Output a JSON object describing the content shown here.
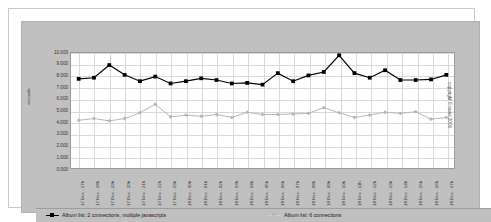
{
  "chart_data": {
    "type": "line",
    "title": "",
    "xlabel": "",
    "ylabel": "seconds",
    "ylim": [
      0,
      10
    ],
    "grid": true,
    "legend_position": "bottom",
    "categories": [
      "17 Dec - 17h",
      "17 Dec - 18h",
      "17 Dec - 19h",
      "17 Dec - 20h",
      "17 Dec - 21h",
      "17 Dec - 22h",
      "17 Dec - 23h",
      "18 Dec - 00h",
      "18 Dec - 01h",
      "18 Dec - 02h",
      "18 Dec - 03h",
      "18 Dec - 04h",
      "18 Dec - 05h",
      "18 Dec - 06h",
      "18 Dec - 07h",
      "18 Dec - 08h",
      "18 Dec - 09h",
      "18 Dec - 10h",
      "18 Dec - 11h",
      "18 Dec - 12h",
      "18 Dec - 13h",
      "18 Dec - 14h",
      "18 Dec - 15h",
      "18 Dec - 16h",
      "18 Dec - 17h"
    ],
    "ytick_labels": [
      "10.000",
      "9.000",
      "8.000",
      "7.000",
      "6.000",
      "5.000",
      "4.000",
      "3.000",
      "2.000",
      "1.000",
      "0.000"
    ],
    "ytick_values": [
      10,
      9,
      8,
      7,
      6,
      5,
      4,
      3,
      2,
      1,
      0
    ],
    "series": [
      {
        "name": "Album list: 2 connections, multiple javascripts",
        "color": "#000000",
        "marker": "square",
        "values": [
          7.75,
          7.85,
          8.95,
          8.1,
          7.55,
          7.95,
          7.35,
          7.55,
          7.8,
          7.65,
          7.35,
          7.4,
          7.25,
          8.25,
          7.55,
          8.05,
          8.35,
          9.8,
          8.25,
          7.85,
          8.5,
          7.65,
          7.65,
          7.7,
          8.1
        ]
      },
      {
        "name": "Album list: 6 connections",
        "color": "#b5b5b5",
        "marker": "diamond",
        "values": [
          4.15,
          4.3,
          4.1,
          4.3,
          4.8,
          5.55,
          4.45,
          4.6,
          4.5,
          4.65,
          4.4,
          4.85,
          4.65,
          4.65,
          4.7,
          4.75,
          5.25,
          4.8,
          4.4,
          4.6,
          4.85,
          4.75,
          4.9,
          4.25,
          4.4
        ]
      }
    ]
  },
  "legend": {
    "items": [
      {
        "label": "Album list: 2 connections, multiple javascripts"
      },
      {
        "label": "Album list: 6 connections"
      }
    ]
  },
  "footer": {
    "copyright": "copyright © ravel 2006"
  },
  "colors": {
    "series_1": "#000000",
    "series_2": "#b5b5b5",
    "canvas_background": "#c0c0c0",
    "plot_background": "#ffffff",
    "gridline": "#d8d8d8"
  }
}
